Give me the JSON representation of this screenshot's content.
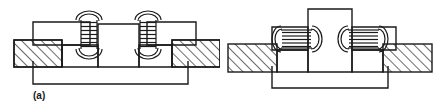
{
  "figure": {
    "type": "engineering-assembly-diagram",
    "background_color": "#ffffff",
    "line_color": "#1a1a1a",
    "hatch_color": "#1a1a1a",
    "panels": [
      {
        "id": "a",
        "caption": "(a)",
        "description": "Two vertical coil springs joining an upper plate to lower hatched blocks",
        "spring_orientation": "vertical",
        "spring_count": 2,
        "hatched_block_count": 2
      },
      {
        "id": "b",
        "caption": "(b)",
        "description": "Central vertical post with two horizontal coil springs to side plates over hatched blocks",
        "spring_orientation": "horizontal",
        "spring_count": 2,
        "hatched_block_count": 2
      }
    ]
  }
}
